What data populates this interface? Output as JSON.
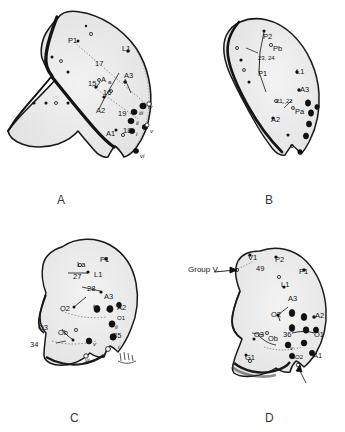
{
  "figure": {
    "background_color": "#ffffff",
    "ink_color": "#111111",
    "panel_letter_color": "#3a3a3a"
  },
  "panels": [
    {
      "id": "A",
      "letter": "A",
      "letter_pos": {
        "x": 57,
        "y": 193
      },
      "labels": [
        {
          "text": "P1",
          "x": 68,
          "y": 37,
          "style": "lbl"
        },
        {
          "text": "L1",
          "x": 122,
          "y": 45,
          "style": "lbl"
        },
        {
          "text": "17",
          "x": 95,
          "y": 60,
          "style": "lbl"
        },
        {
          "text": "A3",
          "x": 124,
          "y": 72,
          "style": "lbl"
        },
        {
          "text": "15",
          "x": 88,
          "y": 80,
          "style": "lbl"
        },
        {
          "text": "A",
          "x": 101,
          "y": 76,
          "style": "lbl"
        },
        {
          "text": "a",
          "x": 108,
          "y": 79,
          "style": "sm"
        },
        {
          "text": "16",
          "x": 103,
          "y": 89,
          "style": "lbl"
        },
        {
          "text": "A2",
          "x": 96,
          "y": 107,
          "style": "lbl"
        },
        {
          "text": "19",
          "x": 118,
          "y": 110,
          "style": "lbl"
        },
        {
          "text": "A1",
          "x": 106,
          "y": 130,
          "style": "lbl"
        },
        {
          "text": "18",
          "x": 123,
          "y": 127,
          "style": "lbl"
        },
        {
          "text": "iv",
          "x": 148,
          "y": 104,
          "style": "it"
        },
        {
          "text": "iii",
          "x": 139,
          "y": 110,
          "style": "it"
        },
        {
          "text": "ii",
          "x": 136,
          "y": 120,
          "style": "it"
        },
        {
          "text": "i",
          "x": 136,
          "y": 131,
          "style": "it"
        },
        {
          "text": "v",
          "x": 150,
          "y": 128,
          "style": "it"
        },
        {
          "text": "vi",
          "x": 140,
          "y": 153,
          "style": "it"
        }
      ]
    },
    {
      "id": "B",
      "letter": "B",
      "letter_pos": {
        "x": 265,
        "y": 193
      },
      "labels": [
        {
          "text": "P2",
          "x": 263,
          "y": 33,
          "style": "lbl"
        },
        {
          "text": "Pb",
          "x": 273,
          "y": 45,
          "style": "lbl"
        },
        {
          "text": "23, 24",
          "x": 258,
          "y": 55,
          "style": "sm"
        },
        {
          "text": "P1",
          "x": 258,
          "y": 70,
          "style": "lbl"
        },
        {
          "text": "L1",
          "x": 296,
          "y": 68,
          "style": "lbl"
        },
        {
          "text": "A3",
          "x": 300,
          "y": 86,
          "style": "lbl"
        },
        {
          "text": "21, 22",
          "x": 276,
          "y": 98,
          "style": "sm"
        },
        {
          "text": "Pa",
          "x": 295,
          "y": 108,
          "style": "lbl"
        },
        {
          "text": "A2",
          "x": 271,
          "y": 116,
          "style": "lbl"
        }
      ]
    },
    {
      "id": "C",
      "letter": "C",
      "letter_pos": {
        "x": 70,
        "y": 411
      },
      "labels": [
        {
          "text": "La",
          "x": 77,
          "y": 261,
          "style": "lbl"
        },
        {
          "text": "P1",
          "x": 100,
          "y": 256,
          "style": "lbl"
        },
        {
          "text": "27",
          "x": 73,
          "y": 273,
          "style": "lbl"
        },
        {
          "text": "L1",
          "x": 94,
          "y": 271,
          "style": "lbl"
        },
        {
          "text": "28",
          "x": 87,
          "y": 285,
          "style": "lbl"
        },
        {
          "text": "A3",
          "x": 104,
          "y": 293,
          "style": "lbl"
        },
        {
          "text": "O2",
          "x": 76,
          "y": 305,
          "style": "lbl"
        },
        {
          "text": "iv",
          "x": 99,
          "y": 303,
          "style": "it"
        },
        {
          "text": "iii",
          "x": 110,
          "y": 306,
          "style": "it"
        },
        {
          "text": "A2",
          "x": 121,
          "y": 304,
          "style": "lbl"
        },
        {
          "text": "O1",
          "x": 117,
          "y": 315,
          "style": "sm"
        },
        {
          "text": "O3",
          "x": 62,
          "y": 324,
          "style": "lbl"
        },
        {
          "text": "Ob",
          "x": 76,
          "y": 329,
          "style": "lbl"
        },
        {
          "text": "ii",
          "x": 115,
          "y": 324,
          "style": "it"
        },
        {
          "text": "34",
          "x": 54,
          "y": 341,
          "style": "lbl"
        },
        {
          "text": "35",
          "x": 117,
          "y": 332,
          "style": "lbl"
        },
        {
          "text": "v",
          "x": 97,
          "y": 341,
          "style": "it"
        },
        {
          "text": "i",
          "x": 120,
          "y": 344,
          "style": "it"
        },
        {
          "text": "vi",
          "x": 92,
          "y": 357,
          "style": "it"
        }
      ]
    },
    {
      "id": "D",
      "letter": "D",
      "letter_pos": {
        "x": 265,
        "y": 411
      },
      "labels": [
        {
          "text": "V1",
          "x": 248,
          "y": 254,
          "style": "lbl"
        },
        {
          "text": "P2",
          "x": 275,
          "y": 256,
          "style": "lbl"
        },
        {
          "text": "49",
          "x": 256,
          "y": 265,
          "style": "lbl"
        },
        {
          "text": "Group V",
          "x": 188,
          "y": 272,
          "style": "big"
        },
        {
          "text": "P1",
          "x": 299,
          "y": 268,
          "style": "lbl"
        },
        {
          "text": "L1",
          "x": 281,
          "y": 281,
          "style": "lbl"
        },
        {
          "text": "A3",
          "x": 288,
          "y": 295,
          "style": "lbl"
        },
        {
          "text": "O2",
          "x": 271,
          "y": 311,
          "style": "lbl"
        },
        {
          "text": "A2",
          "x": 315,
          "y": 312,
          "style": "lbl"
        },
        {
          "text": "O3",
          "x": 254,
          "y": 331,
          "style": "lbl"
        },
        {
          "text": "Ob",
          "x": 268,
          "y": 335,
          "style": "lbl"
        },
        {
          "text": "36",
          "x": 283,
          "y": 331,
          "style": "lbl"
        },
        {
          "text": "O1",
          "x": 314,
          "y": 331,
          "style": "lbl"
        },
        {
          "text": "v",
          "x": 290,
          "y": 345,
          "style": "it"
        },
        {
          "text": "G1",
          "x": 245,
          "y": 354,
          "style": "lbl"
        },
        {
          "text": "SO2",
          "x": 291,
          "y": 354,
          "style": "sm"
        },
        {
          "text": "A1",
          "x": 313,
          "y": 352,
          "style": "lbl"
        }
      ]
    }
  ]
}
